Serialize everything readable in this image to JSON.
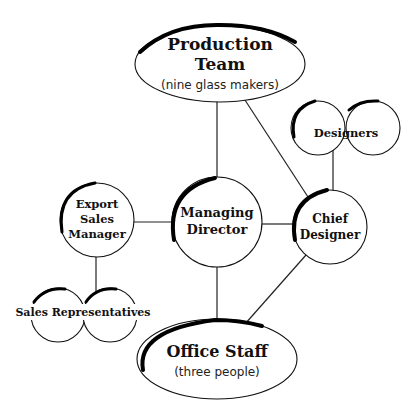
{
  "diagram": {
    "type": "organisational-chart",
    "nodes": {
      "production": {
        "line1": "Production",
        "line2": "Team",
        "sub": "(nine glass makers)"
      },
      "director": {
        "line1": "Managing",
        "line2": "Director"
      },
      "chief": {
        "line1": "Chief",
        "line2": "Designer"
      },
      "designers": {
        "label": "Designers"
      },
      "export": {
        "line1": "Export",
        "line2": "Sales",
        "line3": "Manager"
      },
      "sales_reps": {
        "label": "Sales Representatives"
      },
      "office": {
        "line1": "Office Staff",
        "sub": "(three people)"
      }
    },
    "edges": [
      [
        "production",
        "director"
      ],
      [
        "production",
        "chief"
      ],
      [
        "director",
        "chief"
      ],
      [
        "director",
        "export"
      ],
      [
        "director",
        "office"
      ],
      [
        "chief",
        "designers"
      ],
      [
        "chief",
        "office"
      ],
      [
        "export",
        "sales_reps"
      ]
    ]
  }
}
